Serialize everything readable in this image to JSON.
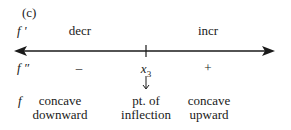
{
  "panel_label": "(c)",
  "rows": {
    "first_derivative": {
      "symbol": "f '",
      "left": "decr",
      "right": "incr"
    },
    "second_derivative": {
      "symbol": "f ″",
      "left": "–",
      "right": "+",
      "point": "x",
      "point_subscript": "3"
    },
    "function": {
      "symbol": "f",
      "left_line1": "concave",
      "left_line2": "downward",
      "middle_line1": "pt. of",
      "middle_line2": "inflection",
      "right_line1": "concave",
      "right_line2": "upward"
    }
  },
  "axis": {
    "direction": "double-arrow",
    "tick_label": "x3"
  }
}
